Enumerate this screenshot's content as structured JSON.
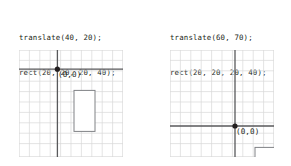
{
  "figure": {
    "background": "#ffffff",
    "grid_color": "#d8d8d8",
    "axis_color": "#58595b",
    "rect_stroke": "#808285",
    "text_color": "#231f20",
    "origin_label": "(0,0)",
    "cell_size": 10.4,
    "grid_cols": 10,
    "grid_rows": 10
  },
  "panels": [
    {
      "id": "panel-left",
      "code": {
        "line1": "translate(40, 20);",
        "line2": "rect(20, 20, 20, 40);"
      },
      "grid": {
        "x": 19,
        "y": 50,
        "width": 104,
        "height": 107,
        "origin_cell_x": 3.7,
        "origin_cell_y": 1.85
      },
      "origin_label": "(0,0)",
      "origin_label_pos": {
        "x": 58,
        "y": 72
      },
      "rect": {
        "x": 74,
        "y": 90,
        "width": 21,
        "height": 41,
        "code_x": 20,
        "code_y": 20,
        "code_w": 20,
        "code_h": 40
      }
    },
    {
      "id": "panel-right",
      "code": {
        "line1": "translate(60, 70);",
        "line2": "rect(20, 20, 20, 40);"
      },
      "grid": {
        "x": 170,
        "y": 50,
        "width": 104,
        "height": 107,
        "origin_cell_x": 6.25,
        "origin_cell_y": 7.3
      },
      "origin_label": "(0,0)",
      "origin_label_pos": {
        "x": 236,
        "y": 129
      },
      "rect": {
        "x": 255,
        "y": 148,
        "width": 21,
        "height": 41,
        "code_x": 20,
        "code_y": 20,
        "code_w": 20,
        "code_h": 40
      }
    }
  ]
}
